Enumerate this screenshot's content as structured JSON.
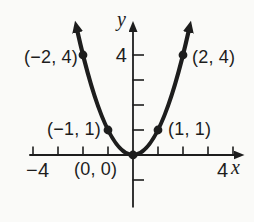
{
  "figure": {
    "background": "#fafaf8",
    "ink": "#1d1d1d",
    "labels": {
      "point_neg2_4": "(−2, 4)",
      "point_2_4": "(2, 4)",
      "point_neg1_1": "(−1, 1)",
      "point_1_1": "(1, 1)",
      "point_0_0": "(0, 0)",
      "y_tick_4": "4",
      "x_tick_neg4": "−4",
      "x_tick_4": "4",
      "x_axis_letter": "x",
      "y_axis_letter": "y"
    }
  },
  "chart_data": {
    "type": "line",
    "title": "",
    "function": "y = x^2",
    "points": [
      {
        "x": -2,
        "y": 4,
        "label": "(−2, 4)"
      },
      {
        "x": -1,
        "y": 1,
        "label": "(−1, 1)"
      },
      {
        "x": 0,
        "y": 0,
        "label": "(0, 0)"
      },
      {
        "x": 1,
        "y": 1,
        "label": "(1, 1)"
      },
      {
        "x": 2,
        "y": 4,
        "label": "(2, 4)"
      }
    ],
    "xlabel": "x",
    "ylabel": "y",
    "x_ticks": [
      -4,
      -3,
      -2,
      -1,
      1,
      2,
      3,
      4
    ],
    "y_ticks": [
      -1,
      1,
      2,
      3,
      4
    ],
    "x_tick_labels_shown": [
      "−4",
      "4"
    ],
    "y_tick_labels_shown": [
      "4"
    ],
    "xlim": [
      -4.15,
      4.1
    ],
    "ylim": [
      -2.1,
      5.0
    ],
    "curve_x_range": [
      -2.24,
      2.24
    ],
    "grid": false,
    "legend": false
  }
}
